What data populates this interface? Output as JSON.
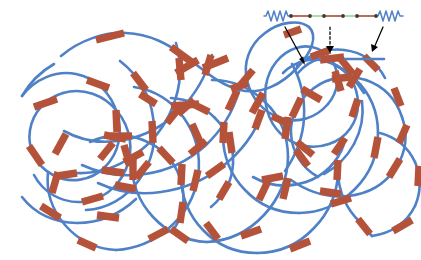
{
  "figure": {
    "title": "Rod-coil polymer network schematic",
    "background_color": "#ffffff"
  },
  "colors": {
    "coil": "#4f81c7",
    "rod": "#b5533a",
    "linker": "#9fd49b",
    "node": "#3b3b3b",
    "arrow": "#000000"
  },
  "legend_inset": {
    "name": "molecular-repeat-unit",
    "left_spring_label": "coil",
    "right_spring_label": "coil",
    "node_count": 6,
    "segments": [
      {
        "type": "coil",
        "color": "#4f81c7"
      },
      {
        "type": "rod",
        "color": "#b5533a"
      },
      {
        "type": "linker",
        "color": "#9fd49b"
      },
      {
        "type": "rod",
        "color": "#b5533a"
      },
      {
        "type": "linker",
        "color": "#9fd49b"
      },
      {
        "type": "rod",
        "color": "#b5533a"
      },
      {
        "type": "coil",
        "color": "#4f81c7"
      }
    ]
  },
  "arrows": [
    {
      "name": "arrow-left",
      "style": "solid",
      "direction": "down-right"
    },
    {
      "name": "arrow-middle",
      "style": "dashed",
      "direction": "down"
    },
    {
      "name": "arrow-right",
      "style": "solid",
      "direction": "down-left"
    }
  ],
  "network": {
    "rod_count": 60,
    "chain_style": "entangled random coil"
  }
}
